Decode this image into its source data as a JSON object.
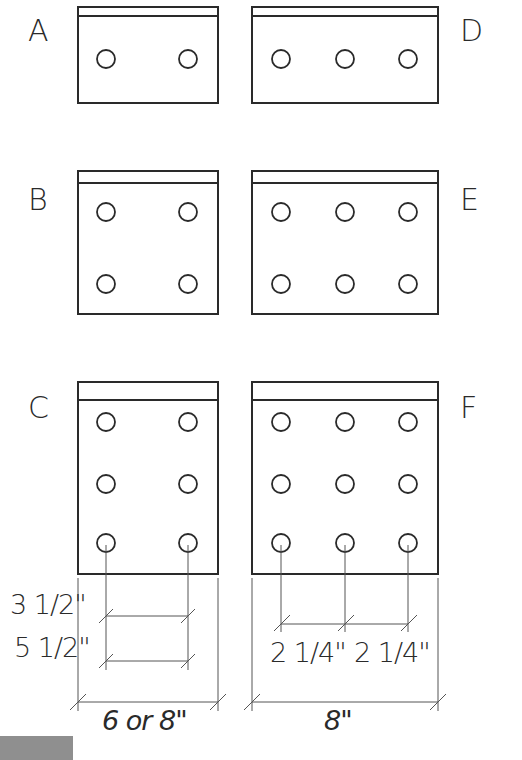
{
  "plates": [
    {
      "label": "A",
      "bolts": "2 holes, 1 row x 2 columns"
    },
    {
      "label": "B",
      "bolts": "4 holes, 2 rows x 2 columns"
    },
    {
      "label": "C",
      "bolts": "6 holes, 3 rows x 2 columns"
    },
    {
      "label": "D",
      "bolts": "3 holes, 1 row x 3 columns"
    },
    {
      "label": "E",
      "bolts": "6 holes, 2 rows x 3 columns"
    },
    {
      "label": "F",
      "bolts": "9 holes, 3 rows x 3 columns"
    }
  ],
  "labels": {
    "A": "A",
    "B": "B",
    "C": "C",
    "D": "D",
    "E": "E",
    "F": "F"
  },
  "dimensions": {
    "left_gauge_a": "3 1/2\"",
    "left_gauge_b": "5 1/2\"",
    "left_width": "6 or 8\"",
    "right_spacing_1": "2 1/4\"",
    "right_spacing_2": "2 1/4\"",
    "right_width": "8\""
  },
  "colors": {
    "line": "#2a2a2a",
    "dimension_line": "#555555",
    "background": "#ffffff",
    "corner_block": "#8f8f8f"
  }
}
